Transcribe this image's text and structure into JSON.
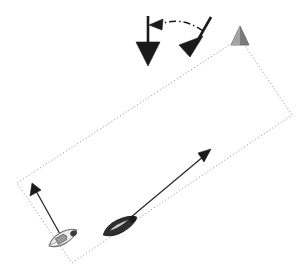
{
  "figure": {
    "title": "",
    "background_color": "#ffffff",
    "width": 306,
    "height": 272
  },
  "colors": {
    "outline_dotted": "#8c8c8c",
    "arrow_black": "#1a1a1a",
    "vessel_dark": "#2b2b2b",
    "vessel_light_fill": "#e6e6e6",
    "vessel_light_stroke": "#7a7a7a",
    "corner_marker_gray": "#777777",
    "corner_marker_light": "#a0a0a0"
  },
  "survey_box": {
    "label": "survey-area-outline",
    "style": "dotted",
    "corners": [
      {
        "name": "top",
        "x": 240,
        "y": 38
      },
      {
        "name": "right",
        "x": 292,
        "y": 115
      },
      {
        "name": "bottom",
        "x": 72,
        "y": 263
      },
      {
        "name": "left",
        "x": 17,
        "y": 183
      }
    ]
  },
  "corner_marker": {
    "label": "gray-triangle-marker",
    "shape": "triangle-up",
    "x": 240,
    "y": 38,
    "size": 15
  },
  "vessels": [
    {
      "name": "vessel-dark",
      "style": "filled",
      "cx": 120,
      "cy": 226,
      "length": 36,
      "width": 13,
      "angle_deg": -28
    },
    {
      "name": "vessel-light",
      "style": "outlined",
      "cx": 63,
      "cy": 238,
      "length": 30,
      "width": 12,
      "angle_deg": -30
    }
  ],
  "track_arrows": [
    {
      "name": "long-track-arrow",
      "x1": 122,
      "y1": 224,
      "x2": 210,
      "y2": 150,
      "head": "solid-triangle"
    },
    {
      "name": "short-track-arrow",
      "x1": 60,
      "y1": 236,
      "x2": 33,
      "y2": 184,
      "head": "solid-triangle"
    }
  ],
  "heading_arrows": [
    {
      "name": "vertical-heading-arrow",
      "x1": 148,
      "y1": 17,
      "x2": 148,
      "y2": 44,
      "head_tip_x": 148,
      "head_tip_y": 66,
      "head_width": 24,
      "direction": "down"
    },
    {
      "name": "tilted-heading-arrow",
      "x1": 210,
      "y1": 18,
      "x2": 196,
      "y2": 44,
      "head_tip_x": 184,
      "head_tip_y": 67,
      "head_width": 22,
      "direction": "down-left"
    }
  ],
  "rotation_arrow": {
    "name": "rotation-dashdot-arrow",
    "style": "dash-dot",
    "from_x": 201,
    "from_y": 29,
    "ctrl_x": 178,
    "ctrl_y": 17,
    "to_x": 158,
    "to_y": 24,
    "head_tip_x": 150,
    "head_tip_y": 25,
    "direction": "left"
  }
}
